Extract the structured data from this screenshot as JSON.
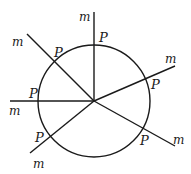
{
  "diagram": {
    "circle": {
      "cx": 94,
      "cy": 101,
      "r": 56,
      "stroke": "#1a1a1a"
    },
    "center": {
      "x": 94,
      "y": 101
    },
    "lines": [
      {
        "id": "top",
        "end": [
          94,
          12
        ],
        "point_label": "P",
        "line_label": "m",
        "p_pos": [
          100,
          42
        ],
        "m_pos": [
          79,
          21
        ]
      },
      {
        "id": "upper-left",
        "end": [
          27,
          34
        ],
        "point_label": "P",
        "line_label": "m",
        "p_pos": [
          55,
          56
        ],
        "m_pos": [
          12,
          44
        ]
      },
      {
        "id": "left",
        "end": [
          10,
          101
        ],
        "point_label": "P",
        "line_label": "m",
        "p_pos": [
          28,
          97
        ],
        "m_pos": [
          9,
          115
        ]
      },
      {
        "id": "lower-left",
        "end": [
          30,
          153
        ],
        "point_label": "P",
        "line_label": "m",
        "p_pos": [
          36,
          141
        ],
        "m_pos": [
          33,
          166
        ]
      },
      {
        "id": "lower-right",
        "end": [
          175,
          146
        ],
        "point_label": "P",
        "line_label": "m",
        "p_pos": [
          141,
          144
        ],
        "m_pos": [
          174,
          142
        ]
      },
      {
        "id": "upper-right",
        "end": [
          175,
          66
        ],
        "point_label": "P",
        "line_label": "m",
        "p_pos": [
          151,
          89
        ],
        "m_pos": [
          166,
          62
        ]
      }
    ]
  }
}
